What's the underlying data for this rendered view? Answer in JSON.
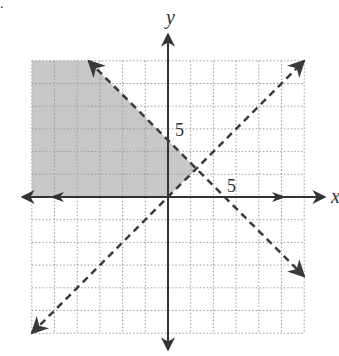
{
  "chart_data": {
    "type": "line",
    "title": "",
    "xlabel": "x",
    "ylabel": "y",
    "xlim": [
      -12,
      12
    ],
    "ylim": [
      -12,
      12
    ],
    "grid": true,
    "grid_step": 2,
    "tick_labels": {
      "x": [
        "5"
      ],
      "y": [
        "5"
      ]
    },
    "series": [
      {
        "name": "y = -x + 5",
        "style": "dashed",
        "slope": -1,
        "intercept": 5,
        "points": [
          [
            -7,
            12
          ],
          [
            12,
            -7
          ]
        ]
      },
      {
        "name": "y = x",
        "style": "dashed",
        "slope": 1,
        "intercept": 0,
        "points": [
          [
            -12,
            -12
          ],
          [
            12,
            12
          ]
        ]
      }
    ],
    "shaded_region": {
      "description": "y >= 0, y > x, y < -x + 5",
      "vertices": [
        [
          -12,
          0
        ],
        [
          0,
          0
        ],
        [
          2.5,
          2.5
        ],
        [
          -7,
          12
        ],
        [
          -12,
          12
        ]
      ],
      "color": "#c8c8c8"
    }
  },
  "labels": {
    "x_axis": "x",
    "y_axis": "y",
    "x_tick": "5",
    "y_tick": "5",
    "corner_mark": "."
  },
  "colors": {
    "axis": "#333333",
    "grid": "#9a9a9a",
    "shade": "#c8c8c8",
    "dashed": "#3a3a3a"
  }
}
